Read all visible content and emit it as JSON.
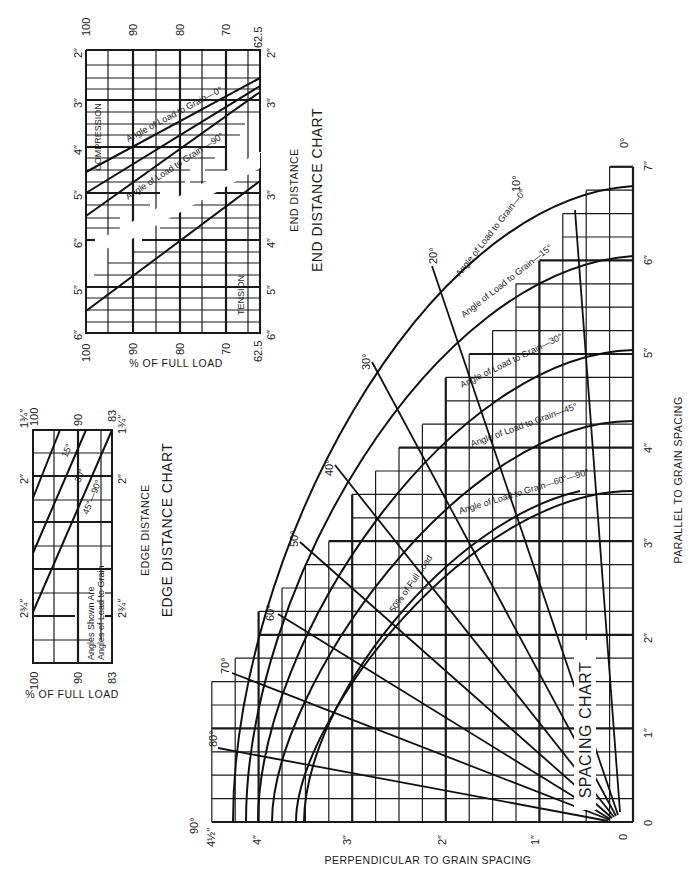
{
  "chart_data": [
    {
      "id": "end_distance",
      "type": "line",
      "title": "END DISTANCE CHART",
      "subtitle": "END DISTANCE",
      "xlabel": "% OF FULL LOAD",
      "x_ticks": [
        "100",
        "90",
        "80",
        "70",
        "62.5"
      ],
      "x_range": [
        100,
        62.5
      ],
      "panels": [
        {
          "name": "COMPRESSION",
          "y_ticks": [
            "2″",
            "3″",
            "4″",
            "5″",
            "6″"
          ],
          "y_range_in": [
            2,
            6
          ],
          "series": [
            {
              "name": "Angle of Load to Grain—0°",
              "points": [
                [
                  100,
                  4.5
                ],
                [
                  62.5,
                  2.65
                ]
              ]
            },
            {
              "name": "Angle of Load to Grain (intermediate)",
              "points": [
                [
                  100,
                  5.0
                ],
                [
                  62.5,
                  2.8
                ]
              ]
            },
            {
              "name": "Angle of Load to Grain—90°",
              "points": [
                [
                  100,
                  5.5
                ],
                [
                  62.5,
                  2.95
                ]
              ]
            }
          ]
        },
        {
          "name": "TENSION",
          "y_ticks": [
            "3″",
            "4″",
            "5″",
            "6″"
          ],
          "y_range_in": [
            3,
            6
          ],
          "series": [
            {
              "name": "Tension",
              "points": [
                [
                  100,
                  5.5
                ],
                [
                  62.5,
                  2.8
                ]
              ]
            }
          ]
        }
      ]
    },
    {
      "id": "edge_distance",
      "type": "line",
      "title": "EDGE DISTANCE CHART",
      "subtitle": "EDGE DISTANCE",
      "xlabel": "% OF FULL LOAD",
      "x_ticks": [
        "100",
        "90",
        "83"
      ],
      "x_range": [
        100,
        83
      ],
      "y_ticks": [
        "1¾″",
        "2″",
        "2¾″"
      ],
      "y_range_in": [
        1.75,
        2.75
      ],
      "note": "Angles Shown Are Angles of Load to Grain",
      "series": [
        {
          "name": "15°",
          "points": [
            [
              100,
              2.05
            ],
            [
              94.8,
              1.75
            ]
          ]
        },
        {
          "name": "30°",
          "points": [
            [
              100,
              2.35
            ],
            [
              89.6,
              1.75
            ]
          ]
        },
        {
          "name": "45°—90°",
          "points": [
            [
              100,
              2.6
            ],
            [
              83,
              1.75
            ]
          ]
        }
      ]
    },
    {
      "id": "spacing",
      "type": "line",
      "title": "SPACING CHART",
      "xlabel": "PERPENDICULAR TO GRAIN SPACING",
      "ylabel": "PARALLEL TO GRAIN SPACING",
      "x_ticks": [
        "0",
        "1″",
        "2″",
        "3″",
        "4″",
        "4½″"
      ],
      "y_ticks": [
        "0",
        "1″",
        "2″",
        "3″",
        "4″",
        "5″",
        "6″",
        "7″"
      ],
      "x_range_in": [
        0,
        4.5
      ],
      "y_range_in": [
        0,
        7
      ],
      "corner_labels": {
        "top": "0°",
        "left": "90°"
      },
      "angle_rays": [
        "10°",
        "20°",
        "30°",
        "40°",
        "50°",
        "60°",
        "70°",
        "80°"
      ],
      "series": [
        {
          "name": "Angle of Load to Grain—0°",
          "parallel_max": 6.75,
          "perp_max": 4.25
        },
        {
          "name": "Angle of Load to Grain—15°",
          "parallel_max": 6.0,
          "perp_max": 4.1
        },
        {
          "name": "Angle of Load to Grain—30°",
          "parallel_max": 5.0,
          "perp_max": 3.95
        },
        {
          "name": "Angle of Load to Grain—45°",
          "parallel_max": 4.25,
          "perp_max": 3.75
        },
        {
          "name": "Angle of Load to Grain—60°—90°",
          "parallel_max": 3.5,
          "perp_max": 3.5
        },
        {
          "name": "50% of Full Load",
          "parallel_max": 3.5,
          "perp_max": 3.5
        }
      ]
    }
  ],
  "labels": {
    "end_title": "END DISTANCE CHART",
    "end_subtitle": "END DISTANCE",
    "end_xlabel": "% OF FULL LOAD",
    "compression": "COMPRESSION",
    "tension": "TENSION",
    "end_curve_0": "Angle of Load to Grain—0°",
    "end_curve_90": "Angle of Load to Grain —90°",
    "edge_title": "EDGE DISTANCE CHART",
    "edge_subtitle": "EDGE DISTANCE",
    "edge_xlabel": "% OF FULL LOAD",
    "edge_note_1": "Angles Shown Are",
    "edge_note_2": "Angles of Load to Grain",
    "edge_15": "15°",
    "edge_30": "30°",
    "edge_45": "45°—90°",
    "spacing_title": "SPACING CHART",
    "spacing_xlabel": "PERPENDICULAR TO GRAIN SPACING",
    "spacing_ylabel": "PARALLEL TO GRAIN SPACING",
    "sp_curve_0": "Angle of Load to Grain—0°",
    "sp_curve_15": "Angle of Load to Grain—15°",
    "sp_curve_30": "Angle of Load to Grain—30°",
    "sp_curve_45": "Angle of Load to Grain—45°",
    "sp_curve_60": "Angle of Load to Grain—60°—90°",
    "sp_curve_50pct": "50% of Full Load",
    "deg_0": "0°",
    "deg_90": "90°",
    "deg_10": "10°",
    "deg_20": "20°",
    "deg_30": "30°",
    "deg_40": "40°",
    "deg_50": "50°",
    "deg_60": "60°",
    "deg_70": "70°",
    "deg_80": "80°"
  },
  "ticks": {
    "end_top": [
      "100",
      "90",
      "80",
      "70",
      "62.5"
    ],
    "end_bottom": [
      "100",
      "90",
      "80",
      "70",
      "62.5"
    ],
    "end_left": [
      "2″",
      "3″",
      "4″",
      "5″",
      "6″",
      "5″",
      "6″"
    ],
    "end_right_comp": [
      "2″",
      "3″"
    ],
    "end_right_tens": [
      "3″",
      "4″",
      "5″",
      "6″"
    ],
    "edge_top": [
      "100",
      "90",
      "83"
    ],
    "edge_bottom": [
      "100",
      "90",
      "83"
    ],
    "edge_left": [
      "1¾″",
      "2″",
      "2¾″"
    ],
    "edge_right": [
      "1¾″",
      "2″",
      "2¾″"
    ],
    "sp_bottom": [
      "4½″",
      "4″",
      "3″",
      "2″",
      "1″",
      "0"
    ],
    "sp_right": [
      "0",
      "1″",
      "2″",
      "3″",
      "4″",
      "5″",
      "6″",
      "7″"
    ]
  }
}
